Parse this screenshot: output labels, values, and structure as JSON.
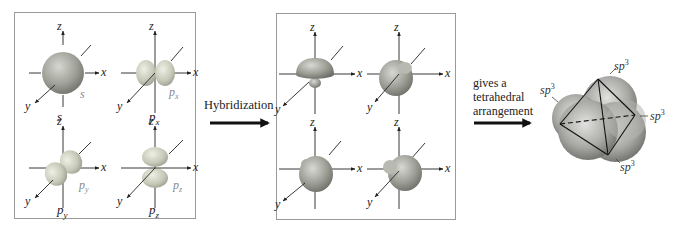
{
  "diagram": {
    "left_panel": {
      "orbitals": [
        {
          "name": "s",
          "inner_label": "s",
          "caption": "s",
          "caption_sub": ""
        },
        {
          "name": "px",
          "inner_label": "px",
          "caption": "p",
          "caption_sub": "x"
        },
        {
          "name": "py",
          "inner_label": "py",
          "caption": "p",
          "caption_sub": "y"
        },
        {
          "name": "pz",
          "inner_label": "pz",
          "caption": "p",
          "caption_sub": "z"
        }
      ]
    },
    "axes": {
      "x": "x",
      "y": "y",
      "z": "z"
    },
    "arrow1": {
      "label": "Hybridization"
    },
    "right_panel": {
      "orbitals": [
        {
          "name": "sp3-up"
        },
        {
          "name": "sp3-back"
        },
        {
          "name": "sp3-front"
        },
        {
          "name": "sp3-left"
        }
      ]
    },
    "arrow2": {
      "line1": "gives a",
      "line2": "tetrahedral",
      "line3": "arrangement"
    },
    "result": {
      "labels": [
        {
          "text": "sp",
          "sup": "3",
          "position": "top"
        },
        {
          "text": "sp",
          "sup": "3",
          "position": "left"
        },
        {
          "text": "sp",
          "sup": "3",
          "position": "right"
        },
        {
          "text": "sp",
          "sup": "3",
          "position": "bottom"
        }
      ]
    },
    "colors": {
      "orbital_fill": "#c9cbbf",
      "orbital_shade": "#8f9187",
      "hybrid_fill": "#a8aaa3",
      "border": "#9a9a9a",
      "axis": "#222222"
    }
  }
}
